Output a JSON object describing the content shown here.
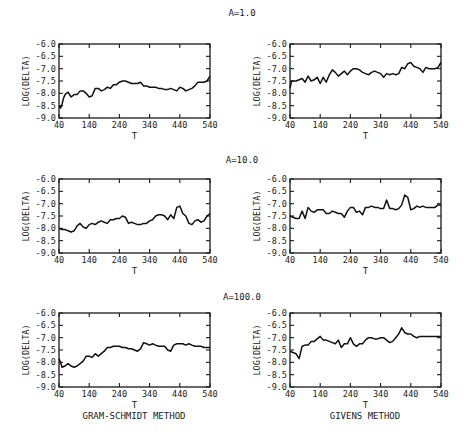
{
  "figure": {
    "row_titles": [
      "A=1.0",
      "A=10.0",
      "A=100.0"
    ],
    "column_captions": [
      "GRAM-SCHMIDT METHOD",
      "GIVENS METHOD"
    ]
  },
  "chart_data": [
    {
      "type": "line",
      "row": 0,
      "col": 0,
      "title": "A=1.0",
      "method": "GRAM-SCHMIDT METHOD",
      "xlabel": "T",
      "ylabel": "LOG(DELTA)",
      "xlim": [
        40,
        540
      ],
      "ylim": [
        -9.0,
        -6.0
      ],
      "xticks": [
        40,
        140,
        240,
        340,
        440,
        540
      ],
      "yticks": [
        -6.0,
        -6.5,
        -7.0,
        -7.5,
        -8.0,
        -8.5,
        -9.0
      ],
      "grid": false,
      "x": [
        40,
        45,
        50,
        55,
        60,
        65,
        70,
        80,
        90,
        100,
        110,
        120,
        130,
        140,
        150,
        160,
        170,
        180,
        190,
        200,
        210,
        220,
        230,
        240,
        250,
        260,
        270,
        280,
        290,
        300,
        310,
        320,
        330,
        340,
        350,
        360,
        370,
        380,
        390,
        400,
        410,
        420,
        430,
        440,
        450,
        460,
        470,
        480,
        490,
        500,
        510,
        520,
        530,
        540
      ],
      "y": [
        -8.5,
        -8.6,
        -8.45,
        -8.2,
        -8.05,
        -8.0,
        -7.95,
        -8.15,
        -8.05,
        -8.05,
        -7.9,
        -7.9,
        -8.0,
        -8.15,
        -8.1,
        -7.8,
        -7.8,
        -7.9,
        -7.85,
        -7.75,
        -7.8,
        -7.65,
        -7.65,
        -7.55,
        -7.5,
        -7.5,
        -7.55,
        -7.6,
        -7.6,
        -7.6,
        -7.55,
        -7.7,
        -7.7,
        -7.75,
        -7.75,
        -7.75,
        -7.8,
        -7.8,
        -7.85,
        -7.85,
        -7.8,
        -7.85,
        -7.9,
        -7.75,
        -7.8,
        -7.9,
        -7.85,
        -7.8,
        -7.7,
        -7.55,
        -7.55,
        -7.55,
        -7.5,
        -7.3
      ]
    },
    {
      "type": "line",
      "row": 0,
      "col": 1,
      "title": "A=1.0",
      "method": "GIVENS METHOD",
      "xlabel": "T",
      "ylabel": "LOG(DELTA)",
      "xlim": [
        40,
        540
      ],
      "ylim": [
        -9.0,
        -6.0
      ],
      "xticks": [
        40,
        140,
        240,
        340,
        440,
        540
      ],
      "yticks": [
        -6.0,
        -6.5,
        -7.0,
        -7.5,
        -8.0,
        -8.5,
        -9.0
      ],
      "grid": false,
      "x": [
        40,
        45,
        50,
        60,
        70,
        80,
        90,
        100,
        110,
        120,
        130,
        140,
        150,
        160,
        170,
        180,
        190,
        200,
        210,
        220,
        230,
        240,
        250,
        260,
        270,
        280,
        290,
        300,
        310,
        320,
        330,
        340,
        350,
        360,
        370,
        380,
        390,
        400,
        410,
        420,
        430,
        440,
        450,
        460,
        470,
        480,
        490,
        500,
        510,
        520,
        530,
        540
      ],
      "y": [
        -7.8,
        -7.5,
        -7.5,
        -7.5,
        -7.45,
        -7.4,
        -7.55,
        -7.3,
        -7.5,
        -7.45,
        -7.35,
        -7.6,
        -7.35,
        -7.55,
        -7.25,
        -7.05,
        -7.15,
        -7.3,
        -7.2,
        -7.1,
        -7.25,
        -7.1,
        -7.0,
        -7.0,
        -7.05,
        -7.15,
        -7.2,
        -7.25,
        -7.15,
        -7.1,
        -7.15,
        -7.2,
        -7.35,
        -7.2,
        -7.25,
        -7.2,
        -7.25,
        -7.2,
        -6.95,
        -7.0,
        -6.8,
        -6.75,
        -6.9,
        -6.95,
        -7.0,
        -7.15,
        -6.95,
        -7.0,
        -7.0,
        -7.0,
        -6.95,
        -6.75
      ]
    },
    {
      "type": "line",
      "row": 1,
      "col": 0,
      "title": "A=10.0",
      "method": "GRAM-SCHMIDT METHOD",
      "xlabel": "T",
      "ylabel": "LOG(DELTA)",
      "xlim": [
        40,
        540
      ],
      "ylim": [
        -9.0,
        -6.0
      ],
      "xticks": [
        40,
        140,
        240,
        340,
        440,
        540
      ],
      "yticks": [
        -6.0,
        -6.5,
        -7.0,
        -7.5,
        -8.0,
        -8.5,
        -9.0
      ],
      "grid": false,
      "x": [
        40,
        50,
        60,
        70,
        80,
        90,
        100,
        110,
        120,
        130,
        140,
        150,
        160,
        170,
        180,
        190,
        200,
        210,
        220,
        230,
        240,
        250,
        260,
        270,
        280,
        290,
        300,
        310,
        320,
        330,
        340,
        350,
        360,
        370,
        380,
        390,
        400,
        410,
        420,
        430,
        440,
        450,
        460,
        470,
        480,
        490,
        500,
        510,
        520,
        530,
        540
      ],
      "y": [
        -8.0,
        -8.05,
        -8.05,
        -8.1,
        -8.15,
        -8.1,
        -7.9,
        -7.8,
        -7.95,
        -8.0,
        -7.85,
        -7.8,
        -7.85,
        -7.75,
        -7.7,
        -7.75,
        -7.8,
        -7.65,
        -7.65,
        -7.6,
        -7.6,
        -7.5,
        -7.55,
        -7.8,
        -7.75,
        -7.8,
        -7.85,
        -7.85,
        -7.8,
        -7.8,
        -7.7,
        -7.65,
        -7.5,
        -7.45,
        -7.45,
        -7.5,
        -7.65,
        -7.45,
        -7.6,
        -7.15,
        -7.1,
        -7.4,
        -7.5,
        -7.8,
        -7.85,
        -7.7,
        -7.65,
        -7.75,
        -7.7,
        -7.5,
        -7.4
      ]
    },
    {
      "type": "line",
      "row": 1,
      "col": 1,
      "title": "A=10.0",
      "method": "GIVENS METHOD",
      "xlabel": "T",
      "ylabel": "LOG(DELTA)",
      "xlim": [
        40,
        540
      ],
      "ylim": [
        -9.0,
        -6.0
      ],
      "xticks": [
        40,
        140,
        240,
        340,
        440,
        540
      ],
      "yticks": [
        -6.0,
        -6.5,
        -7.0,
        -7.5,
        -8.0,
        -8.5,
        -9.0
      ],
      "grid": false,
      "x": [
        40,
        50,
        60,
        70,
        80,
        90,
        100,
        110,
        120,
        130,
        140,
        150,
        160,
        170,
        180,
        190,
        200,
        210,
        220,
        230,
        240,
        250,
        260,
        270,
        280,
        290,
        300,
        310,
        320,
        330,
        340,
        350,
        360,
        370,
        380,
        390,
        400,
        410,
        420,
        430,
        440,
        450,
        460,
        470,
        480,
        490,
        500,
        510,
        520,
        530,
        540
      ],
      "y": [
        -7.5,
        -7.55,
        -7.6,
        -7.6,
        -7.3,
        -7.6,
        -7.15,
        -7.3,
        -7.35,
        -7.25,
        -7.25,
        -7.25,
        -7.4,
        -7.4,
        -7.3,
        -7.35,
        -7.4,
        -7.4,
        -7.55,
        -7.3,
        -7.15,
        -7.15,
        -7.35,
        -7.3,
        -7.45,
        -7.15,
        -7.15,
        -7.1,
        -7.15,
        -7.15,
        -7.2,
        -7.2,
        -6.85,
        -7.2,
        -7.2,
        -7.25,
        -7.2,
        -7.05,
        -6.65,
        -6.75,
        -7.25,
        -7.2,
        -7.1,
        -7.15,
        -7.1,
        -7.15,
        -7.15,
        -7.15,
        -7.15,
        -7.05,
        -7.05
      ]
    },
    {
      "type": "line",
      "row": 2,
      "col": 0,
      "title": "A=100.0",
      "method": "GRAM-SCHMIDT METHOD",
      "xlabel": "T",
      "ylabel": "LOG(DELTA)",
      "xlim": [
        40,
        540
      ],
      "ylim": [
        -9.0,
        -6.0
      ],
      "xticks": [
        40,
        140,
        240,
        340,
        440,
        540
      ],
      "yticks": [
        -6.0,
        -6.5,
        -7.0,
        -7.5,
        -8.0,
        -8.5,
        -9.0
      ],
      "grid": false,
      "x": [
        40,
        45,
        50,
        60,
        70,
        80,
        90,
        100,
        110,
        120,
        130,
        140,
        150,
        160,
        170,
        180,
        190,
        200,
        210,
        220,
        230,
        240,
        250,
        260,
        270,
        280,
        290,
        300,
        310,
        320,
        330,
        340,
        350,
        360,
        370,
        380,
        390,
        400,
        410,
        420,
        430,
        440,
        450,
        460,
        470,
        480,
        490,
        500,
        510,
        520,
        530,
        540
      ],
      "y": [
        -7.85,
        -8.0,
        -8.2,
        -8.15,
        -8.05,
        -8.15,
        -8.2,
        -8.15,
        -8.05,
        -7.95,
        -7.75,
        -7.75,
        -7.8,
        -7.65,
        -7.75,
        -7.65,
        -7.55,
        -7.4,
        -7.4,
        -7.35,
        -7.35,
        -7.35,
        -7.4,
        -7.4,
        -7.45,
        -7.45,
        -7.5,
        -7.55,
        -7.45,
        -7.2,
        -7.25,
        -7.3,
        -7.25,
        -7.3,
        -7.35,
        -7.35,
        -7.35,
        -7.5,
        -7.55,
        -7.3,
        -7.25,
        -7.25,
        -7.25,
        -7.3,
        -7.25,
        -7.3,
        -7.35,
        -7.35,
        -7.35,
        -7.4,
        -7.4,
        -7.4
      ]
    },
    {
      "type": "line",
      "row": 2,
      "col": 1,
      "title": "A=100.0",
      "method": "GIVENS METHOD",
      "xlabel": "T",
      "ylabel": "LOG(DELTA)",
      "xlim": [
        40,
        540
      ],
      "ylim": [
        -9.0,
        -6.0
      ],
      "xticks": [
        40,
        140,
        240,
        340,
        440,
        540
      ],
      "yticks": [
        -6.0,
        -6.5,
        -7.0,
        -7.5,
        -8.0,
        -8.5,
        -9.0
      ],
      "grid": false,
      "x": [
        40,
        50,
        60,
        70,
        80,
        90,
        100,
        110,
        120,
        130,
        140,
        150,
        160,
        170,
        180,
        190,
        200,
        210,
        220,
        230,
        240,
        250,
        260,
        270,
        280,
        290,
        300,
        310,
        320,
        330,
        340,
        350,
        360,
        370,
        380,
        390,
        400,
        410,
        420,
        430,
        440,
        450,
        460,
        470,
        480,
        490,
        500,
        510,
        520,
        530,
        540
      ],
      "y": [
        -7.55,
        -7.6,
        -7.65,
        -7.85,
        -7.35,
        -7.3,
        -7.3,
        -7.15,
        -7.15,
        -7.05,
        -6.95,
        -7.1,
        -7.1,
        -7.15,
        -7.2,
        -7.25,
        -7.1,
        -7.4,
        -7.25,
        -7.25,
        -7.0,
        -7.25,
        -7.35,
        -7.25,
        -7.25,
        -7.1,
        -7.0,
        -7.0,
        -7.05,
        -7.05,
        -7.0,
        -7.0,
        -7.1,
        -7.2,
        -7.15,
        -7.0,
        -6.85,
        -6.6,
        -6.8,
        -6.85,
        -6.85,
        -6.95,
        -7.0,
        -6.95,
        -6.95,
        -6.95,
        -6.95,
        -6.95,
        -6.95,
        -6.95,
        -6.95
      ]
    }
  ]
}
